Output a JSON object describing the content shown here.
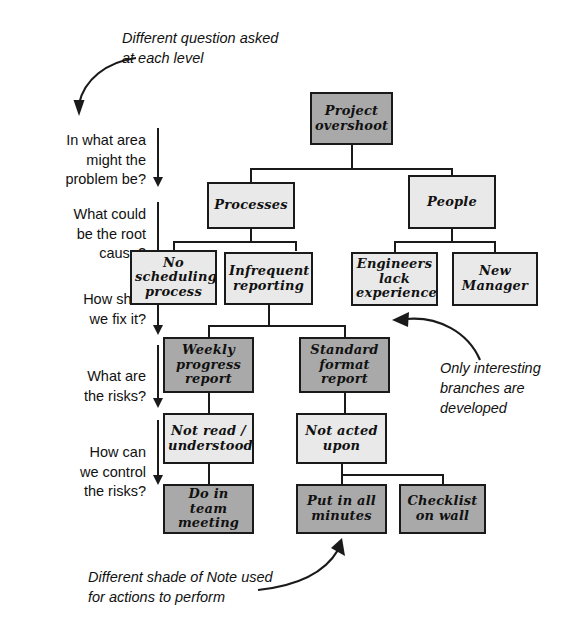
{
  "diagram": {
    "colors": {
      "note_problem_fill": "#e9e9e9",
      "note_action_fill": "#a9a9a9",
      "outline": "#1a1a1a",
      "background": "#ffffff"
    }
  },
  "question_column": {
    "items": [
      {
        "id": "q1",
        "text": "In what area\nmight the\nproblem be?"
      },
      {
        "id": "q2",
        "text": "What could\nbe the root\ncause?"
      },
      {
        "id": "q3",
        "text": "How shall\nwe fix it?"
      },
      {
        "id": "q4",
        "text": "What are\nthe risks?"
      },
      {
        "id": "q5",
        "text": "How can\nwe control\nthe risks?"
      }
    ]
  },
  "annotations": [
    {
      "id": "a1",
      "text": "Different question asked\nat each level"
    },
    {
      "id": "a2",
      "text": "Only interesting\nbranches are\ndeveloped"
    },
    {
      "id": "a3",
      "text": "Different shade of Note used\nfor actions to perform"
    }
  ],
  "nodes": [
    {
      "id": "n1",
      "label": "Project\novershoot",
      "shade": "dark"
    },
    {
      "id": "n2",
      "label": "Processes",
      "shade": "light"
    },
    {
      "id": "n3",
      "label": "People",
      "shade": "light"
    },
    {
      "id": "n4",
      "label": "No\nscheduling\nprocess",
      "shade": "light"
    },
    {
      "id": "n5",
      "label": "Infrequent\nreporting",
      "shade": "light"
    },
    {
      "id": "n6",
      "label": "Engineers\nlack\nexperience",
      "shade": "light"
    },
    {
      "id": "n7",
      "label": "New\nManager",
      "shade": "light"
    },
    {
      "id": "n8",
      "label": "Weekly\nprogress\nreport",
      "shade": "dark"
    },
    {
      "id": "n9",
      "label": "Standard\nformat\nreport",
      "shade": "dark"
    },
    {
      "id": "n10",
      "label": "Not read /\nunderstood",
      "shade": "light"
    },
    {
      "id": "n11",
      "label": "Not acted\nupon",
      "shade": "light"
    },
    {
      "id": "n12",
      "label": "Do in team\nmeeting",
      "shade": "dark"
    },
    {
      "id": "n13",
      "label": "Put in all\nminutes",
      "shade": "dark"
    },
    {
      "id": "n14",
      "label": "Checklist\non wall",
      "shade": "dark"
    }
  ]
}
